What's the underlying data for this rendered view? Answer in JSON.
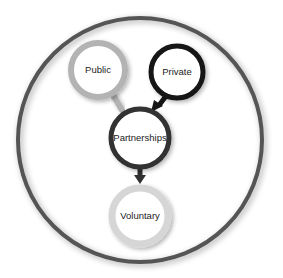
{
  "diagram": {
    "container": {
      "name": "sector-scope",
      "color": "#555555"
    },
    "nodes": [
      {
        "id": "public",
        "label": "Public",
        "color": "#b3b3b3"
      },
      {
        "id": "private",
        "label": "Private",
        "color": "#151515"
      },
      {
        "id": "partnerships",
        "label": "Partnerships",
        "color": "#303030"
      },
      {
        "id": "voluntary",
        "label": "Voluntary",
        "color": "#d6d6d6"
      }
    ],
    "edges": [
      {
        "from": "public",
        "to": "partnerships",
        "color": "#b3b3b3",
        "arrowhead": false
      },
      {
        "from": "private",
        "to": "partnerships",
        "color": "#151515",
        "arrowhead": true
      },
      {
        "from": "partnerships",
        "to": "voluntary",
        "color": "#303030",
        "arrowhead": true
      }
    ]
  }
}
